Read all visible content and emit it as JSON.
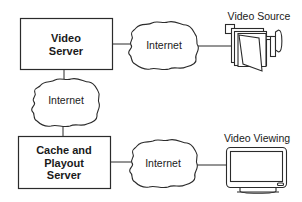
{
  "diagram": {
    "nodes": {
      "video_server": {
        "line1": "Video",
        "line2": "Server"
      },
      "cache_server": {
        "line1": "Cache and",
        "line2": "Playout",
        "line3": "Server"
      },
      "internet_top": {
        "label": "Internet"
      },
      "internet_left": {
        "label": "Internet"
      },
      "internet_bottom": {
        "label": "Internet"
      },
      "video_source": {
        "label": "Video Source",
        "icon": "video-camera-icon"
      },
      "video_viewing": {
        "label": "Video Viewing",
        "icon": "monitor-icon"
      }
    },
    "edges": [
      {
        "from": "video_server",
        "to": "internet_top"
      },
      {
        "from": "internet_top",
        "to": "video_source"
      },
      {
        "from": "video_server",
        "to": "internet_left"
      },
      {
        "from": "internet_left",
        "to": "cache_server"
      },
      {
        "from": "cache_server",
        "to": "internet_bottom"
      },
      {
        "from": "internet_bottom",
        "to": "video_viewing"
      }
    ],
    "colors": {
      "stroke": "#2b2b2b",
      "background": "#ffffff"
    }
  }
}
